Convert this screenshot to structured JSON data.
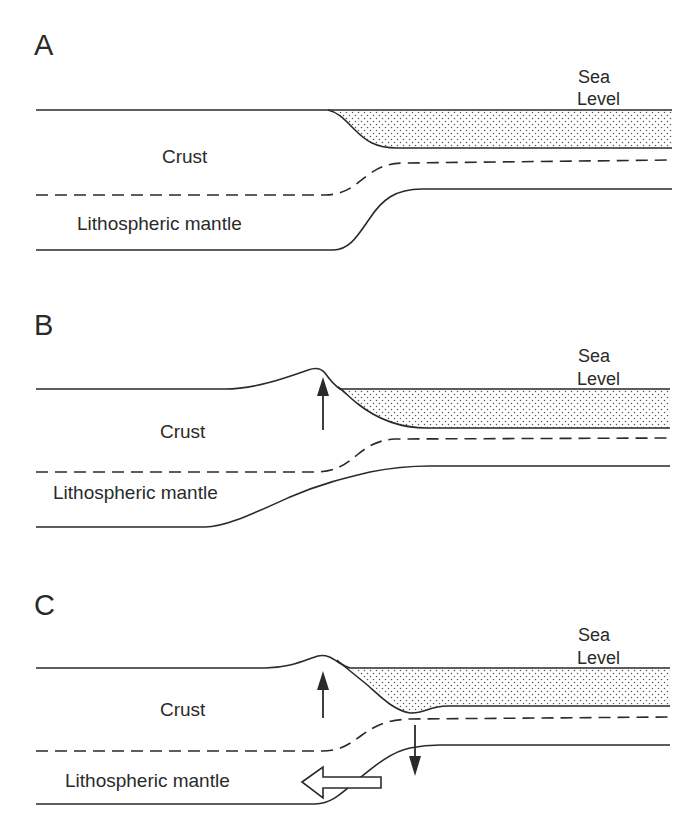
{
  "figure": {
    "colors": {
      "ink": "#2a2a2a",
      "background": "#ffffff",
      "water_stipple": "#555555"
    },
    "panels": [
      {
        "id": "A",
        "letter": "A",
        "sea_label_line1": "Sea",
        "sea_label_line2": "Level",
        "crust_label": "Crust",
        "mantle_label": "Lithospheric mantle",
        "arrows": []
      },
      {
        "id": "B",
        "letter": "B",
        "sea_label_line1": "Sea",
        "sea_label_line2": "Level",
        "crust_label": "Crust",
        "mantle_label": "Lithospheric mantle",
        "arrows": [
          "uplift-arrow-up"
        ]
      },
      {
        "id": "C",
        "letter": "C",
        "sea_label_line1": "Sea",
        "sea_label_line2": "Level",
        "crust_label": "Crust",
        "mantle_label": "Lithospheric mantle",
        "arrows": [
          "uplift-arrow-up",
          "subsidence-arrow-down",
          "mantle-flow-arrow-left-hollow"
        ]
      }
    ]
  }
}
